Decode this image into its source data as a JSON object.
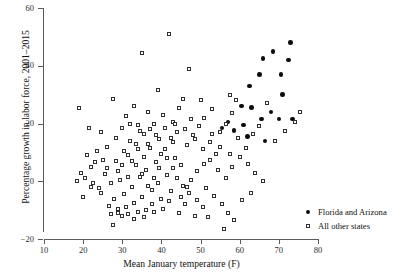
{
  "chart_data": {
    "type": "scatter",
    "title": "",
    "xlabel": "Mean January temperature (F)",
    "ylabel": "Percentage growth in labor force, 2001–2015",
    "xlim": [
      10,
      80
    ],
    "ylim": [
      -20,
      60
    ],
    "xticks": [
      10,
      20,
      30,
      40,
      50,
      60,
      70,
      80
    ],
    "yticks": [
      -20,
      0,
      20,
      40,
      60
    ],
    "xtick_labels": [
      "10",
      "20",
      "30",
      "40",
      "50",
      "60",
      "70",
      "80"
    ],
    "ytick_labels": [
      "−20",
      "0",
      "20",
      "40",
      "60"
    ],
    "grid": false,
    "legend_position": "right-bottom",
    "series": [
      {
        "name": "Florida and Arizona",
        "marker": "filled-circle",
        "color": "#0c0c0c",
        "points": [
          [
            62.5,
            33.0
          ],
          [
            65.0,
            37.0
          ],
          [
            66.0,
            42.5
          ],
          [
            68.5,
            45.0
          ],
          [
            70.5,
            37.0
          ],
          [
            72.5,
            42.0
          ],
          [
            73.0,
            48.0
          ],
          [
            71.0,
            30.0
          ],
          [
            68.0,
            24.0
          ],
          [
            65.5,
            21.5
          ],
          [
            70.0,
            21.5
          ],
          [
            73.5,
            21.5
          ],
          [
            63.0,
            25.5
          ],
          [
            60.5,
            26.0
          ],
          [
            66.5,
            14.0
          ],
          [
            62.0,
            15.5
          ],
          [
            58.5,
            17.5
          ],
          [
            55.5,
            18.5
          ],
          [
            61.0,
            19.5
          ],
          [
            57.0,
            20.5
          ]
        ]
      },
      {
        "name": "All other states",
        "marker": "open-square",
        "color": "#303030",
        "points": [
          [
            19.0,
            25.5
          ],
          [
            21.5,
            18.5
          ],
          [
            24.5,
            17.0
          ],
          [
            27.5,
            28.5
          ],
          [
            31.0,
            22.5
          ],
          [
            33.0,
            26.0
          ],
          [
            35.0,
            44.5
          ],
          [
            36.5,
            24.0
          ],
          [
            39.0,
            31.5
          ],
          [
            42.0,
            51.0
          ],
          [
            44.5,
            25.5
          ],
          [
            45.5,
            28.5
          ],
          [
            47.0,
            39.0
          ],
          [
            43.0,
            20.5
          ],
          [
            40.5,
            23.0
          ],
          [
            38.0,
            20.0
          ],
          [
            34.0,
            19.5
          ],
          [
            32.0,
            20.0
          ],
          [
            30.0,
            18.5
          ],
          [
            28.5,
            15.0
          ],
          [
            26.0,
            12.0
          ],
          [
            23.5,
            10.5
          ],
          [
            22.0,
            5.0
          ],
          [
            20.5,
            1.0
          ],
          [
            25.0,
            7.5
          ],
          [
            27.0,
            -0.5
          ],
          [
            29.0,
            3.5
          ],
          [
            31.5,
            9.0
          ],
          [
            33.5,
            13.0
          ],
          [
            35.5,
            16.5
          ],
          [
            37.0,
            18.0
          ],
          [
            39.5,
            14.5
          ],
          [
            41.0,
            11.0
          ],
          [
            43.5,
            8.0
          ],
          [
            45.0,
            5.5
          ],
          [
            46.5,
            12.5
          ],
          [
            48.0,
            16.0
          ],
          [
            49.5,
            19.0
          ],
          [
            51.0,
            22.0
          ],
          [
            52.5,
            13.5
          ],
          [
            54.0,
            9.5
          ],
          [
            55.0,
            17.0
          ],
          [
            56.5,
            20.0
          ],
          [
            58.0,
            23.5
          ],
          [
            59.5,
            15.0
          ],
          [
            61.5,
            11.5
          ],
          [
            63.5,
            16.5
          ],
          [
            65.0,
            19.0
          ],
          [
            67.0,
            27.0
          ],
          [
            69.0,
            14.0
          ],
          [
            71.5,
            17.5
          ],
          [
            74.0,
            20.5
          ],
          [
            75.5,
            24.0
          ],
          [
            57.5,
            30.0
          ],
          [
            59.0,
            28.0
          ],
          [
            53.0,
            25.0
          ],
          [
            50.0,
            28.0
          ],
          [
            47.5,
            21.5
          ],
          [
            44.0,
            17.0
          ],
          [
            42.5,
            15.0
          ],
          [
            40.0,
            9.5
          ],
          [
            38.5,
            6.5
          ],
          [
            36.0,
            4.0
          ],
          [
            34.5,
            1.5
          ],
          [
            32.5,
            -2.0
          ],
          [
            30.5,
            -4.5
          ],
          [
            28.0,
            -6.0
          ],
          [
            26.5,
            -8.5
          ],
          [
            24.0,
            -2.5
          ],
          [
            22.5,
            -0.5
          ],
          [
            27.2,
            -11.5
          ],
          [
            28.8,
            -11.0
          ],
          [
            31.0,
            -9.0
          ],
          [
            33.0,
            -7.5
          ],
          [
            35.0,
            -5.5
          ],
          [
            37.5,
            -3.0
          ],
          [
            39.0,
            -0.5
          ],
          [
            41.5,
            2.0
          ],
          [
            43.0,
            4.5
          ],
          [
            45.5,
            -1.5
          ],
          [
            47.0,
            -4.0
          ],
          [
            49.0,
            -6.5
          ],
          [
            51.5,
            -2.5
          ],
          [
            53.5,
            -5.0
          ],
          [
            55.5,
            -8.0
          ],
          [
            57.0,
            -11.0
          ],
          [
            58.5,
            -13.5
          ],
          [
            56.0,
            -16.5
          ],
          [
            27.5,
            -15.0
          ],
          [
            30.0,
            -12.0
          ],
          [
            34.0,
            -10.5
          ],
          [
            36.0,
            -10.0
          ],
          [
            38.0,
            -10.5
          ],
          [
            40.5,
            -9.5
          ],
          [
            42.0,
            -7.0
          ],
          [
            44.5,
            -11.0
          ],
          [
            46.0,
            -8.0
          ],
          [
            48.5,
            -12.0
          ],
          [
            50.5,
            -9.0
          ],
          [
            52.0,
            -12.5
          ],
          [
            29.5,
            0.5
          ],
          [
            31.5,
            1.5
          ],
          [
            33.5,
            5.5
          ],
          [
            35.5,
            8.5
          ],
          [
            37.0,
            11.5
          ],
          [
            25.5,
            2.5
          ],
          [
            23.0,
            6.5
          ],
          [
            21.0,
            9.0
          ],
          [
            19.5,
            3.0
          ],
          [
            18.5,
            0.0
          ],
          [
            26.0,
            4.5
          ],
          [
            28.5,
            7.0
          ],
          [
            30.5,
            10.5
          ],
          [
            32.0,
            14.0
          ],
          [
            34.5,
            17.5
          ],
          [
            36.5,
            13.0
          ],
          [
            38.5,
            16.0
          ],
          [
            41.0,
            18.5
          ],
          [
            43.5,
            20.0
          ],
          [
            46.0,
            18.0
          ],
          [
            48.5,
            14.5
          ],
          [
            50.5,
            11.0
          ],
          [
            52.5,
            7.5
          ],
          [
            54.5,
            4.0
          ],
          [
            56.5,
            1.0
          ],
          [
            58.0,
            5.0
          ],
          [
            60.0,
            8.5
          ],
          [
            62.0,
            6.0
          ],
          [
            64.0,
            3.0
          ],
          [
            66.0,
            0.0
          ],
          [
            63.0,
            -4.0
          ],
          [
            60.5,
            -6.5
          ],
          [
            57.5,
            9.5
          ],
          [
            55.0,
            12.0
          ],
          [
            53.0,
            16.5
          ],
          [
            51.0,
            6.0
          ],
          [
            49.0,
            3.5
          ],
          [
            47.5,
            0.5
          ],
          [
            45.0,
            -5.5
          ],
          [
            42.5,
            -3.5
          ],
          [
            40.0,
            -6.0
          ],
          [
            37.5,
            -8.0
          ],
          [
            35.5,
            -12.5
          ],
          [
            33.0,
            -13.0
          ],
          [
            31.5,
            -11.5
          ],
          [
            29.0,
            -9.5
          ],
          [
            24.5,
            -4.0
          ],
          [
            22.0,
            -2.0
          ],
          [
            20.0,
            -5.5
          ],
          [
            43.0,
            13.5
          ],
          [
            41.5,
            8.0
          ],
          [
            39.5,
            4.5
          ],
          [
            44.0,
            1.0
          ],
          [
            46.5,
            -2.0
          ],
          [
            34.0,
            11.0
          ],
          [
            32.5,
            7.0
          ],
          [
            30.0,
            5.5
          ],
          [
            35.0,
            2.5
          ],
          [
            36.5,
            -1.5
          ],
          [
            38.0,
            1.0
          ]
        ]
      }
    ]
  },
  "legend": {
    "items": [
      {
        "label": "Florida and Arizona",
        "marker": "filled-circle"
      },
      {
        "label": "All other states",
        "marker": "open-square"
      }
    ]
  }
}
